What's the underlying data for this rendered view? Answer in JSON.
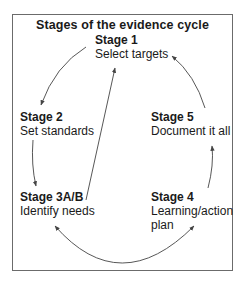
{
  "diagram": {
    "title": "Stages of the evidence cycle",
    "nodes": [
      {
        "id": "stage1",
        "heading": "Stage 1",
        "lines": [
          "Select targets"
        ]
      },
      {
        "id": "stage2",
        "heading": "Stage 2",
        "lines": [
          "Set standards"
        ]
      },
      {
        "id": "stage3",
        "heading": "Stage 3A/B",
        "lines": [
          "Identify needs"
        ]
      },
      {
        "id": "stage4",
        "heading": "Stage 4",
        "lines": [
          "Learning/action",
          "plan"
        ]
      },
      {
        "id": "stage5",
        "heading": "Stage 5",
        "lines": [
          "Document it all"
        ]
      }
    ],
    "edges": [
      {
        "from": "stage1",
        "to": "stage2"
      },
      {
        "from": "stage2",
        "to": "stage3"
      },
      {
        "from": "stage3",
        "to": "stage1"
      },
      {
        "from": "stage4",
        "to": "stage3"
      },
      {
        "from": "stage3",
        "to": "stage4"
      },
      {
        "from": "stage4",
        "to": "stage5"
      },
      {
        "from": "stage5",
        "to": "stage1"
      }
    ],
    "colors": {
      "frame": "#6b6b6b",
      "arrow": "#444444",
      "text": "#1a1a1a"
    }
  }
}
